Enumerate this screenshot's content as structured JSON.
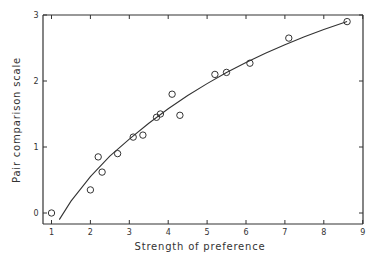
{
  "chart_data": {
    "type": "scatter",
    "title": "",
    "xlabel": "Strength of preference",
    "ylabel": "Pair comparison scale",
    "xlim": [
      0.9,
      9
    ],
    "ylim": [
      -0.15,
      3
    ],
    "xticks": [
      "1",
      "2",
      "3",
      "4",
      "5",
      "6",
      "7",
      "8",
      "9"
    ],
    "yticks": [
      "0",
      "1",
      "2",
      "3"
    ],
    "grid": false,
    "legend": null,
    "series": [
      {
        "name": "observed",
        "marker": "open-circle",
        "x": [
          1.0,
          2.0,
          2.2,
          2.3,
          2.7,
          3.1,
          3.35,
          3.7,
          3.8,
          4.1,
          4.3,
          5.2,
          5.5,
          6.1,
          7.1,
          8.6
        ],
        "y": [
          0.0,
          0.35,
          0.85,
          0.62,
          0.9,
          1.15,
          1.18,
          1.45,
          1.5,
          1.8,
          1.48,
          2.1,
          2.13,
          2.27,
          2.65,
          2.9
        ]
      },
      {
        "name": "fitted curve",
        "type": "line",
        "x": [
          1.2,
          1.5,
          2.0,
          2.5,
          3.0,
          3.5,
          4.0,
          4.5,
          5.0,
          5.5,
          6.0,
          6.5,
          7.0,
          7.5,
          8.0,
          8.6
        ],
        "y": [
          -0.1,
          0.18,
          0.55,
          0.86,
          1.12,
          1.36,
          1.58,
          1.78,
          1.96,
          2.13,
          2.28,
          2.42,
          2.55,
          2.67,
          2.78,
          2.9
        ]
      }
    ]
  }
}
